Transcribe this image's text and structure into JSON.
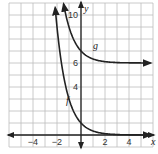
{
  "chart_data": {
    "type": "line",
    "title": "",
    "xlabel": "x",
    "ylabel": "y",
    "xlim": [
      -6,
      6
    ],
    "ylim": [
      -1,
      11
    ],
    "grid": true,
    "x_ticks": [
      -4,
      -2,
      2,
      4
    ],
    "y_ticks": [
      4,
      6,
      10
    ],
    "x_tick_labels": [
      "−4",
      "−2",
      "2",
      "4"
    ],
    "y_tick_labels": [
      "4",
      "6",
      "10"
    ],
    "series": [
      {
        "name": "f",
        "label": "f",
        "description": "decreasing exponential, asymptote y=0, passes (0,1)",
        "x": [
          -2.2,
          -2,
          -1.5,
          -1,
          -0.5,
          0,
          0.5,
          1,
          2,
          3,
          4,
          5
        ],
        "values": [
          11,
          9,
          5.2,
          3,
          1.7,
          1,
          0.58,
          0.33,
          0.11,
          0.04,
          0.01,
          0.0
        ]
      },
      {
        "name": "g",
        "label": "g",
        "description": "decreasing exponential, asymptote y=6, passes (0,7)",
        "x": [
          -1.8,
          -1.5,
          -1,
          -0.5,
          0,
          0.5,
          1,
          2,
          3,
          4,
          5
        ],
        "values": [
          11,
          9.8,
          8.5,
          7.6,
          7,
          6.6,
          6.35,
          6.12,
          6.04,
          6.01,
          6.0
        ]
      }
    ],
    "series_labels": {
      "f": "f",
      "g": "g"
    },
    "axis_labels": {
      "x": "x",
      "y": "y"
    }
  }
}
